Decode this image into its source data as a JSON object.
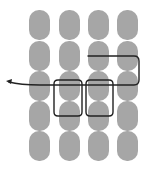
{
  "diagram": {
    "background": "#ffffff",
    "pill_color": "#a6a6a6",
    "line_color": "#222222",
    "grid": {
      "columns": 4,
      "rows": 5,
      "col_x": [
        29,
        59,
        88,
        117
      ],
      "row_y": [
        10,
        41,
        71,
        101,
        131
      ],
      "pill_width": 21,
      "pill_height": 30,
      "pill_radius": 10
    },
    "paths": [
      {
        "name": "upper-loop-arrow",
        "d": "M 88 56 L 134 56 Q 139 56 139 61 L 139 80 Q 139 85 134 85 L 40 85 Q 20 85 9 82"
      },
      {
        "name": "left-box",
        "d": "M 58 80 L 78 80 Q 82 80 82 84 L 82 112 Q 82 116 78 116 L 58 116 Q 54 116 54 112 L 54 84 Q 54 80 58 80 Z"
      },
      {
        "name": "right-box",
        "d": "M 90 80 L 109 80 Q 113 80 113 84 L 113 112 Q 113 116 109 116 L 90 116 Q 86 116 86 112 L 86 84 Q 86 80 90 80 Z"
      }
    ],
    "arrowhead": {
      "tip_x": 6,
      "tip_y": 81,
      "points": "6,81 12,79 11,84"
    }
  }
}
